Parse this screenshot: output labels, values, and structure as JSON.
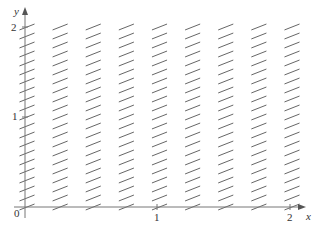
{
  "chart_data": {
    "type": "direction_field",
    "title": "",
    "xlabel": "x",
    "ylabel": "y",
    "xlim": [
      0,
      2
    ],
    "ylim": [
      0,
      2
    ],
    "x_ticks": [
      {
        "value": 0,
        "label": "0"
      },
      {
        "value": 1,
        "label": "1"
      },
      {
        "value": 2,
        "label": "2"
      }
    ],
    "y_ticks": [
      {
        "value": 1,
        "label": "1"
      },
      {
        "value": 2,
        "label": "2"
      }
    ],
    "grid": false,
    "field": {
      "x_values": [
        0,
        0.25,
        0.5,
        0.75,
        1.0,
        1.25,
        1.5,
        1.75,
        2.0
      ],
      "y_values": [
        0,
        0.1,
        0.2,
        0.3,
        0.4,
        0.5,
        0.6,
        0.7,
        0.8,
        0.9,
        1.0,
        1.1,
        1.2,
        1.3,
        1.4,
        1.5,
        1.6,
        1.7,
        1.8,
        1.9,
        2.0
      ],
      "approx_slope": 0.5,
      "segment_color": "#555555"
    },
    "axis_color": "#777777"
  },
  "labels": {
    "origin": "0",
    "x_axis": "x",
    "y_axis": "y",
    "x_tick_1": "1",
    "x_tick_2": "2",
    "y_tick_1": "1",
    "y_tick_2": "2"
  }
}
